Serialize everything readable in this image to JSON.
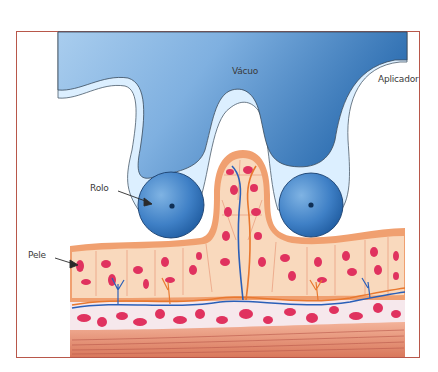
{
  "diagram": {
    "labels": {
      "vacuum": "Vácuo",
      "applicator": "Aplicador",
      "roller": "Rolo",
      "skin": "Pele"
    },
    "colors": {
      "frame_border": "#b8574a",
      "applicator_light": "#9dc6e8",
      "applicator_dark": "#2f6fb0",
      "applicator_rim": "#dcefff",
      "roller_light": "#6ea4d9",
      "roller_dark": "#1f5ea3",
      "skin_outer": "#f0a070",
      "skin_epidermis": "#f9d9bd",
      "fat_cells": "#e0325f",
      "dermis_bg": "#f6e8ec",
      "muscle": "#e8987c",
      "vein": "#2a5fb8",
      "artery": "#e8782f"
    }
  }
}
